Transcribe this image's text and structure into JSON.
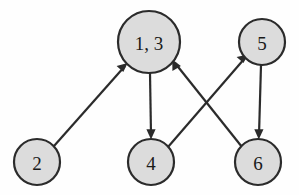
{
  "figure": {
    "name": "directed-graph-diagram",
    "background_color": "#fefefe",
    "node_fill_color": "#dcdcdc",
    "node_stroke_color": "#2b2b2b",
    "edge_color": "#2b2b2b"
  },
  "graph": {
    "type": "directed",
    "nodes": [
      {
        "id": "n13",
        "label": "1, 3",
        "cx": 149,
        "cy": 42,
        "r": 31
      },
      {
        "id": "n5",
        "label": "5",
        "cx": 262,
        "cy": 42,
        "r": 23
      },
      {
        "id": "n2",
        "label": "2",
        "cx": 37,
        "cy": 162,
        "r": 23
      },
      {
        "id": "n4",
        "label": "4",
        "cx": 151,
        "cy": 162,
        "r": 23
      },
      {
        "id": "n6",
        "label": "6",
        "cx": 258,
        "cy": 162,
        "r": 23
      }
    ],
    "edges": [
      {
        "id": "e_2_13",
        "from": "2",
        "to": "1, 3",
        "directed": true
      },
      {
        "id": "e_13_4",
        "from": "1, 3",
        "to": "4",
        "directed": true
      },
      {
        "id": "e_4_5",
        "from": "4",
        "to": "5",
        "directed": true
      },
      {
        "id": "e_6_13",
        "from": "6",
        "to": "1, 3",
        "directed": true
      },
      {
        "id": "e_5_6",
        "from": "5",
        "to": "6",
        "directed": true
      }
    ]
  }
}
